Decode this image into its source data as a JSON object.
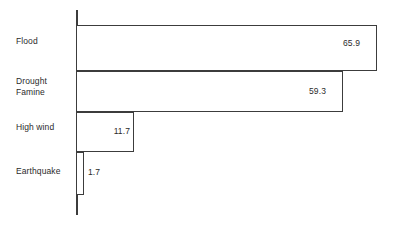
{
  "chart_data": {
    "type": "bar",
    "orientation": "horizontal",
    "title": "",
    "subtitle": "",
    "xlabel": "",
    "ylabel": "",
    "grid": false,
    "legend": false,
    "legend_position": "none",
    "xlim": [
      0,
      65.9
    ],
    "categories": [
      "Flood",
      "Drought\nFamine",
      "High wind",
      "Earthquake"
    ],
    "values": [
      65.9,
      59.3,
      11.7,
      1.7
    ],
    "value_labels": [
      "65.9",
      "59.3",
      "11.7",
      "1.7"
    ],
    "series": [
      {
        "name": "",
        "values": [
          65.9,
          59.3,
          11.7,
          1.7
        ]
      }
    ],
    "bars": [
      {
        "category": "Flood",
        "category_line1": "Flood",
        "category_line2": "",
        "value": 65.9,
        "value_label": "65.9",
        "label_placement": "inside-right"
      },
      {
        "category": "Drought Famine",
        "category_line1": "Drought",
        "category_line2": "Famine",
        "value": 59.3,
        "value_label": "59.3",
        "label_placement": "inside-right"
      },
      {
        "category": "High wind",
        "category_line1": "High wind",
        "category_line2": "",
        "value": 11.7,
        "value_label": "11.7",
        "label_placement": "inside-right"
      },
      {
        "category": "Earthquake",
        "category_line1": "Earthquake",
        "category_line2": "",
        "value": 1.7,
        "value_label": "1.7",
        "label_placement": "outside-right"
      }
    ],
    "colors": {
      "bar_fill": "#ffffff",
      "bar_stroke": "#3c3c3c",
      "axis": "#3c3c3c",
      "text": "#2b2b2b",
      "background": "#ffffff"
    }
  },
  "geometry": {
    "axis_x": 76,
    "axis_top": 10,
    "axis_bottom": 215,
    "label_x": 16,
    "bar_rows": [
      {
        "top": 25,
        "height": 46,
        "right": 377,
        "label_center_y": 43,
        "value_right": 356,
        "value_y": 39
      },
      {
        "top": 71,
        "height": 41,
        "right": 343,
        "label_center_y": 86,
        "value_right": 322,
        "value_y": 87
      },
      {
        "top": 112,
        "height": 40,
        "right": 134,
        "label_center_y": 128,
        "value_right": 126,
        "value_y": 127
      },
      {
        "top": 152,
        "height": 43,
        "right": 84,
        "label_center_y": 171,
        "value_right": 0,
        "value_y": 168,
        "value_left": 88
      }
    ],
    "label_tops": [
      36,
      76,
      122,
      166
    ]
  }
}
